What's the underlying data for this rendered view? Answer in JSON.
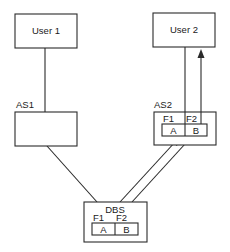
{
  "diagram": {
    "nodes": {
      "user1": {
        "label": "User 1"
      },
      "user2": {
        "label": "User 2"
      },
      "as1": {
        "label": "AS1"
      },
      "as2": {
        "label": "AS2",
        "fields": [
          "F1",
          "F2"
        ],
        "cells": [
          "A",
          "B"
        ]
      },
      "dbs": {
        "label": "DBS",
        "fields": [
          "F1",
          "F2"
        ],
        "cells": [
          "A",
          "B"
        ]
      }
    },
    "edges": [
      {
        "from": "User 1",
        "to": "AS1",
        "type": "line"
      },
      {
        "from": "AS1",
        "to": "DBS",
        "type": "line"
      },
      {
        "from": "User 2",
        "to": "AS2",
        "type": "line"
      },
      {
        "from": "AS2 F2/B",
        "to": "User 2",
        "type": "arrow"
      },
      {
        "from": "DBS",
        "to": "AS2 F1/A",
        "type": "double-line-arrow"
      }
    ]
  }
}
